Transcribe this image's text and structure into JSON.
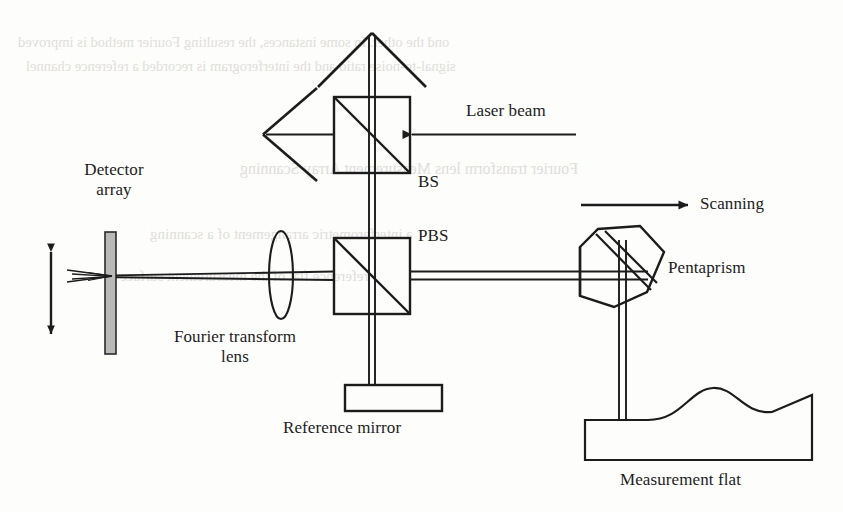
{
  "figure": {
    "kind": "optical-schematic",
    "stroke_color": "#1c1c1c",
    "detector_fill": "#b9b9b9",
    "background": "#fdfdfc"
  },
  "labels": {
    "detector_array": "Detector\narray",
    "detector_array_line1": "Detector",
    "detector_array_line2": "array",
    "laser_beam": "Laser beam",
    "bs": "BS",
    "pbs": "PBS",
    "scanning": "Scanning",
    "pentaprism": "Pentaprism",
    "fourier_lens_line1": "Fourier transform",
    "fourier_lens_line2": "lens",
    "reference_mirror": "Reference mirror",
    "measurement_flat": "Measurement flat"
  },
  "components": [
    {
      "id": "detector-array",
      "name": "Detector array",
      "shape": "filled-vertical-bar",
      "x": 105,
      "y": 232,
      "width": 11,
      "height": 122
    },
    {
      "id": "motion-arrow",
      "name": "Detector motion arrow",
      "shape": "double-headed-vertical-arrow",
      "x": 51,
      "y": 249,
      "height": 88
    },
    {
      "id": "fourier-lens",
      "name": "Fourier transform lens",
      "shape": "ellipse",
      "cx": 281,
      "cy": 275,
      "rx": 12,
      "ry": 44
    },
    {
      "id": "beam-splitter",
      "name": "BS",
      "shape": "square-with-diagonal",
      "x": 334,
      "y": 97,
      "size": 76
    },
    {
      "id": "polarizing-beam-splitter",
      "name": "PBS",
      "shape": "square-with-diagonal",
      "x": 334,
      "y": 238,
      "size": 76
    },
    {
      "id": "reference-mirror",
      "name": "Reference mirror",
      "shape": "rectangle",
      "x": 345,
      "y": 385,
      "width": 97,
      "height": 26
    },
    {
      "id": "pentaprism",
      "name": "Pentaprism",
      "shape": "rotated-pentagon",
      "cx": 620,
      "cy": 263
    },
    {
      "id": "measurement-flat",
      "name": "Measurement flat",
      "shape": "wavy-top-block",
      "x": 585,
      "y": 405,
      "width": 230,
      "height": 55
    }
  ],
  "beams": [
    {
      "id": "laser-input",
      "name": "Laser beam input",
      "from": [
        575,
        134
      ],
      "to": [
        410,
        134
      ],
      "arrow": "filled-left"
    },
    {
      "id": "bs-up-output",
      "name": "Upward output beam",
      "from": [
        372,
        97
      ],
      "to": [
        372,
        33
      ],
      "arrow": "open-up"
    },
    {
      "id": "bs-left-output",
      "name": "Leftward output beam",
      "from": [
        334,
        134
      ],
      "to": [
        262,
        134
      ],
      "arrow": "open-left"
    },
    {
      "id": "bs-to-pbs",
      "name": "BS to PBS vertical beam",
      "from": [
        372,
        172
      ],
      "to": [
        372,
        238
      ]
    },
    {
      "id": "pbs-to-lens",
      "name": "PBS to lens to detector beam",
      "from": [
        334,
        275
      ],
      "to": [
        116,
        275
      ]
    },
    {
      "id": "pbs-to-mirror",
      "name": "PBS to reference mirror",
      "from": [
        372,
        312
      ],
      "to": [
        372,
        385
      ]
    },
    {
      "id": "pbs-to-pentaprism",
      "name": "PBS to pentaprism",
      "from": [
        410,
        275
      ],
      "to": [
        600,
        275
      ]
    },
    {
      "id": "pentaprism-to-flat",
      "name": "Pentaprism to measurement flat",
      "from": [
        622,
        300
      ],
      "to": [
        622,
        420
      ]
    }
  ],
  "annotations": [
    {
      "id": "scanning-arrow",
      "name": "Scanning direction arrow",
      "from": [
        581,
        205
      ],
      "to": [
        692,
        205
      ],
      "arrow": "filled-right"
    }
  ],
  "ghost_text": {
    "note": "faint bleed-through text from reverse of printed page",
    "lines": [
      "ond the other. In some instances, the resulting Fourier method is improved",
      "signal-to-noise ratio and the interferogram is recorded a reference channel",
      "Fourier transform lens Measurement Array Scanning",
      "a interferometric arrangement of a scanning",
      "reference flat of the measurement surface"
    ]
  }
}
